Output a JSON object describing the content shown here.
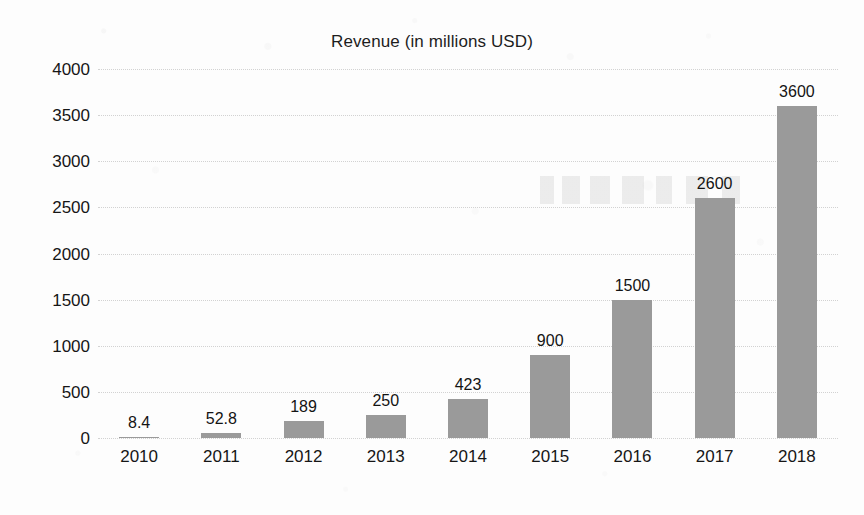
{
  "chart_data": {
    "type": "bar",
    "title": "Revenue (in millions USD)",
    "xlabel": "",
    "ylabel": "",
    "categories": [
      "2010",
      "2011",
      "2012",
      "2013",
      "2014",
      "2015",
      "2016",
      "2017",
      "2018"
    ],
    "values": [
      8.4,
      52.8,
      189,
      250,
      423,
      900,
      1500,
      2600,
      3600
    ],
    "value_labels": [
      "8.4",
      "52.8",
      "189",
      "250",
      "423",
      "900",
      "1500",
      "2600",
      "3600"
    ],
    "ylim": [
      0,
      4000
    ],
    "y_ticks": [
      4000,
      3500,
      3000,
      2500,
      2000,
      1500,
      1000,
      500,
      0
    ],
    "y_tick_labels": [
      "4000",
      "3500",
      "3000",
      "2500",
      "2000",
      "1500",
      "1000",
      "500",
      "0"
    ],
    "grid": true,
    "legend": false,
    "bar_color": "#9a9a9a",
    "grid_color": "#d2d2d2",
    "text_color": "#161616",
    "background_color": "#fdfdfd"
  }
}
